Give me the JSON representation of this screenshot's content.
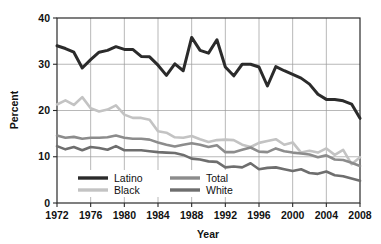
{
  "chart_data": {
    "type": "line",
    "title": "",
    "xlabel": "Year",
    "ylabel": "Percent",
    "xlim": [
      1972,
      2008
    ],
    "ylim": [
      0,
      40
    ],
    "grid": true,
    "legend_position": "inside-bottom-left",
    "xticks": [
      "1972",
      "1976",
      "1980",
      "1984",
      "1988",
      "1992",
      "1996",
      "2000",
      "2004",
      "2008"
    ],
    "yticks": [
      "0",
      "10",
      "20",
      "30",
      "40"
    ],
    "x": [
      1972,
      1973,
      1974,
      1975,
      1976,
      1977,
      1978,
      1979,
      1980,
      1981,
      1982,
      1983,
      1984,
      1985,
      1986,
      1987,
      1988,
      1989,
      1990,
      1991,
      1992,
      1993,
      1994,
      1995,
      1996,
      1997,
      1998,
      1999,
      2000,
      2001,
      2002,
      2003,
      2004,
      2005,
      2006,
      2007,
      2008
    ],
    "series": [
      {
        "name": "Latino",
        "color": "#2b2b2b",
        "width": 3.0,
        "values": [
          34.0,
          33.4,
          32.6,
          29.2,
          31.0,
          32.6,
          33.0,
          33.8,
          33.2,
          33.2,
          31.7,
          31.6,
          29.8,
          27.6,
          30.1,
          28.6,
          35.8,
          33.0,
          32.4,
          35.3,
          29.4,
          27.5,
          30.0,
          30.0,
          29.4,
          25.3,
          29.5,
          28.6,
          27.8,
          27.0,
          25.7,
          23.5,
          22.4,
          22.4,
          22.1,
          21.4,
          18.3
        ]
      },
      {
        "name": "Black",
        "color": "#c3c3c3",
        "width": 2.6,
        "values": [
          21.3,
          22.2,
          21.2,
          22.9,
          20.5,
          19.8,
          20.2,
          21.1,
          19.1,
          18.4,
          18.4,
          18.0,
          15.5,
          15.2,
          14.2,
          14.1,
          14.5,
          13.8,
          13.2,
          13.6,
          13.7,
          13.6,
          12.6,
          12.1,
          13.0,
          13.4,
          13.8,
          12.6,
          13.1,
          10.9,
          11.3,
          10.9,
          11.8,
          10.4,
          11.5,
          8.4,
          9.9
        ]
      },
      {
        "name": "Total",
        "color": "#8c8c8c",
        "width": 2.6,
        "values": [
          14.6,
          14.1,
          14.3,
          13.9,
          14.1,
          14.1,
          14.2,
          14.6,
          14.1,
          13.9,
          13.9,
          13.7,
          13.1,
          12.6,
          12.2,
          12.6,
          12.9,
          12.6,
          12.1,
          12.5,
          11.0,
          11.0,
          11.5,
          12.0,
          11.1,
          11.0,
          11.8,
          11.2,
          10.9,
          10.7,
          10.5,
          9.9,
          10.3,
          9.4,
          9.3,
          8.7,
          8.0
        ]
      },
      {
        "name": "White",
        "color": "#6e6e6e",
        "width": 2.6,
        "values": [
          12.3,
          11.6,
          12.1,
          11.4,
          12.1,
          11.9,
          11.5,
          12.3,
          11.4,
          11.4,
          11.4,
          11.2,
          11.0,
          10.9,
          10.8,
          10.4,
          9.6,
          9.4,
          9.0,
          8.9,
          7.7,
          7.9,
          7.7,
          8.6,
          7.3,
          7.6,
          7.7,
          7.3,
          6.9,
          7.3,
          6.5,
          6.3,
          6.8,
          6.0,
          5.8,
          5.3,
          4.8
        ]
      }
    ],
    "legend": [
      {
        "label": "Latino",
        "color": "#2b2b2b",
        "column": 0,
        "row": 0
      },
      {
        "label": "Black",
        "color": "#c3c3c3",
        "column": 0,
        "row": 1
      },
      {
        "label": "Total",
        "color": "#8c8c8c",
        "column": 1,
        "row": 0
      },
      {
        "label": "White",
        "color": "#6e6e6e",
        "column": 1,
        "row": 1
      }
    ]
  }
}
